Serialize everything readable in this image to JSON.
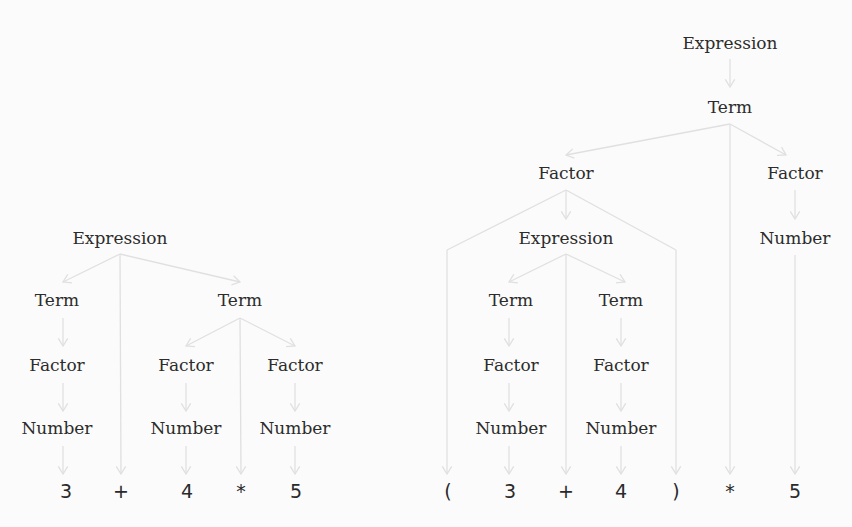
{
  "colors": {
    "background": "#fbfbfb",
    "edge": "#e0e0e0",
    "text": "#2c2c2c"
  },
  "trees": [
    {
      "id": "left-tree",
      "expression": "3 + 4 * 5",
      "nodes": [
        {
          "id": "L_expr",
          "label": "Expression",
          "x": 120,
          "y": 238
        },
        {
          "id": "L_term1",
          "label": "Term",
          "x": 57,
          "y": 300
        },
        {
          "id": "L_term2",
          "label": "Term",
          "x": 240,
          "y": 300
        },
        {
          "id": "L_fac1",
          "label": "Factor",
          "x": 57,
          "y": 365
        },
        {
          "id": "L_fac2",
          "label": "Factor",
          "x": 186,
          "y": 365
        },
        {
          "id": "L_fac3",
          "label": "Factor",
          "x": 295,
          "y": 365
        },
        {
          "id": "L_num1",
          "label": "Number",
          "x": 57,
          "y": 428
        },
        {
          "id": "L_num2",
          "label": "Number",
          "x": 186,
          "y": 428
        },
        {
          "id": "L_num3",
          "label": "Number",
          "x": 295,
          "y": 428
        }
      ],
      "tokens": [
        {
          "id": "L_t3",
          "label": "3",
          "x": 66,
          "y": 492
        },
        {
          "id": "L_tplus",
          "label": "+",
          "x": 121,
          "y": 492
        },
        {
          "id": "L_t4",
          "label": "4",
          "x": 187,
          "y": 492
        },
        {
          "id": "L_tmul",
          "label": "*",
          "x": 241,
          "y": 492
        },
        {
          "id": "L_t5",
          "label": "5",
          "x": 296,
          "y": 492
        }
      ],
      "edges": [
        {
          "from": [
            120,
            254
          ],
          "to": [
            63,
            282
          ]
        },
        {
          "from": [
            120,
            254
          ],
          "to": [
            121,
            474
          ]
        },
        {
          "from": [
            120,
            254
          ],
          "to": [
            240,
            282
          ]
        },
        {
          "from": [
            63,
            318
          ],
          "to": [
            63,
            346
          ]
        },
        {
          "from": [
            240,
            318
          ],
          "to": [
            186,
            346
          ]
        },
        {
          "from": [
            240,
            318
          ],
          "to": [
            241,
            474
          ]
        },
        {
          "from": [
            240,
            318
          ],
          "to": [
            295,
            346
          ]
        },
        {
          "from": [
            63,
            383
          ],
          "to": [
            63,
            411
          ]
        },
        {
          "from": [
            186,
            383
          ],
          "to": [
            186,
            411
          ]
        },
        {
          "from": [
            295,
            383
          ],
          "to": [
            295,
            411
          ]
        },
        {
          "from": [
            63,
            446
          ],
          "to": [
            63,
            474
          ]
        },
        {
          "from": [
            186,
            446
          ],
          "to": [
            186,
            474
          ]
        },
        {
          "from": [
            295,
            446
          ],
          "to": [
            295,
            474
          ]
        }
      ]
    },
    {
      "id": "right-tree",
      "expression": "( 3 + 4 ) * 5",
      "nodes": [
        {
          "id": "R_expr",
          "label": "Expression",
          "x": 730,
          "y": 43
        },
        {
          "id": "R_term",
          "label": "Term",
          "x": 730,
          "y": 107
        },
        {
          "id": "R_fac1",
          "label": "Factor",
          "x": 566,
          "y": 173
        },
        {
          "id": "R_fac2",
          "label": "Factor",
          "x": 795,
          "y": 173
        },
        {
          "id": "R_expr2",
          "label": "Expression",
          "x": 566,
          "y": 238
        },
        {
          "id": "R_num0",
          "label": "Number",
          "x": 795,
          "y": 238
        },
        {
          "id": "R_term1",
          "label": "Term",
          "x": 511,
          "y": 300
        },
        {
          "id": "R_term2",
          "label": "Term",
          "x": 621,
          "y": 300
        },
        {
          "id": "R_fac3",
          "label": "Factor",
          "x": 511,
          "y": 365
        },
        {
          "id": "R_fac4",
          "label": "Factor",
          "x": 621,
          "y": 365
        },
        {
          "id": "R_num1",
          "label": "Number",
          "x": 511,
          "y": 428
        },
        {
          "id": "R_num2",
          "label": "Number",
          "x": 621,
          "y": 428
        }
      ],
      "tokens": [
        {
          "id": "R_tlp",
          "label": "(",
          "x": 448,
          "y": 492
        },
        {
          "id": "R_t3",
          "label": "3",
          "x": 510,
          "y": 492
        },
        {
          "id": "R_tplus",
          "label": "+",
          "x": 566,
          "y": 492
        },
        {
          "id": "R_t4",
          "label": "4",
          "x": 621,
          "y": 492
        },
        {
          "id": "R_trp",
          "label": ")",
          "x": 676,
          "y": 492
        },
        {
          "id": "R_tmul",
          "label": "*",
          "x": 730,
          "y": 492
        },
        {
          "id": "R_t5",
          "label": "5",
          "x": 795,
          "y": 492
        }
      ],
      "edges": [
        {
          "from": [
            730,
            59
          ],
          "to": [
            730,
            87
          ]
        },
        {
          "from": [
            730,
            124
          ],
          "to": [
            566,
            155
          ]
        },
        {
          "from": [
            730,
            124
          ],
          "to": [
            730,
            474
          ]
        },
        {
          "from": [
            730,
            124
          ],
          "to": [
            786,
            155
          ]
        },
        {
          "from": [
            566,
            190
          ],
          "to": [
            566,
            219
          ]
        },
        {
          "from": [
            566,
            190
          ],
          "to": [
            447,
            250
          ],
          "via": true
        },
        {
          "from": [
            447,
            250
          ],
          "to": [
            447,
            474
          ]
        },
        {
          "from": [
            566,
            190
          ],
          "to": [
            676,
            250
          ],
          "via": true
        },
        {
          "from": [
            676,
            250
          ],
          "to": [
            676,
            474
          ]
        },
        {
          "from": [
            795,
            190
          ],
          "to": [
            795,
            219
          ]
        },
        {
          "from": [
            795,
            255
          ],
          "to": [
            795,
            474
          ]
        },
        {
          "from": [
            566,
            254
          ],
          "to": [
            509,
            282
          ]
        },
        {
          "from": [
            566,
            254
          ],
          "to": [
            566,
            474
          ]
        },
        {
          "from": [
            566,
            254
          ],
          "to": [
            625,
            282
          ]
        },
        {
          "from": [
            509,
            318
          ],
          "to": [
            509,
            346
          ]
        },
        {
          "from": [
            621,
            318
          ],
          "to": [
            621,
            346
          ]
        },
        {
          "from": [
            509,
            383
          ],
          "to": [
            509,
            411
          ]
        },
        {
          "from": [
            621,
            383
          ],
          "to": [
            621,
            411
          ]
        },
        {
          "from": [
            509,
            446
          ],
          "to": [
            509,
            474
          ]
        },
        {
          "from": [
            621,
            446
          ],
          "to": [
            621,
            474
          ]
        }
      ]
    }
  ]
}
